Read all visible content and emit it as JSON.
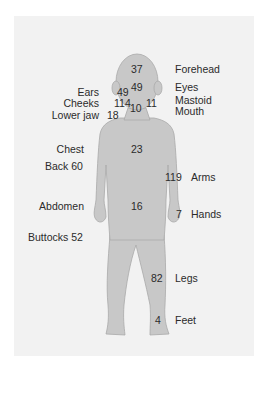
{
  "colors": {
    "panel_background": "#f2f2f2",
    "body_fill": "#c8c8c8",
    "body_stroke": "#a9a9a9",
    "text": "#2b2b2b"
  },
  "regions": [
    {
      "key": "forehead",
      "label": "Forehead",
      "value": "37"
    },
    {
      "key": "eyes",
      "label": "Eyes",
      "value": "49"
    },
    {
      "key": "ears",
      "label": "Ears",
      "value": "49"
    },
    {
      "key": "cheeks",
      "label": "Cheeks",
      "value": "114"
    },
    {
      "key": "mastoid",
      "label": "Mastoid",
      "value": "11"
    },
    {
      "key": "mouth",
      "label": "Mouth",
      "value": "10"
    },
    {
      "key": "lower_jaw",
      "label": "Lower jaw",
      "value": "18"
    },
    {
      "key": "chest",
      "label": "Chest",
      "value": "23"
    },
    {
      "key": "back",
      "label": "Back",
      "value": "60"
    },
    {
      "key": "arms",
      "label": "Arms",
      "value": "119"
    },
    {
      "key": "abdomen",
      "label": "Abdomen",
      "value": "16"
    },
    {
      "key": "hands",
      "label": "Hands",
      "value": "7"
    },
    {
      "key": "buttocks",
      "label": "Buttocks",
      "value": "52"
    },
    {
      "key": "legs",
      "label": "Legs",
      "value": "82"
    },
    {
      "key": "feet",
      "label": "Feet",
      "value": "4"
    }
  ]
}
